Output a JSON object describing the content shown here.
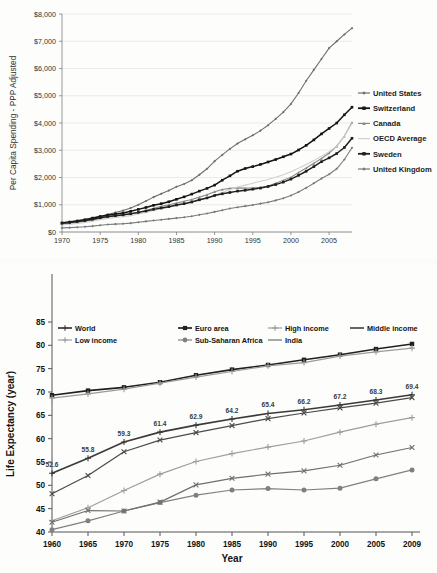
{
  "chart_data": [
    {
      "type": "line",
      "id": "health-spending",
      "title": "",
      "xlabel": "",
      "ylabel": "Per Capita Spending - PPP Adjusted",
      "xlim": [
        1970,
        2008
      ],
      "ylim": [
        0,
        8000
      ],
      "ytick_labels": [
        "$0",
        "$1,000",
        "$2,000",
        "$3,000",
        "$4,000",
        "$5,000",
        "$6,000",
        "$7,000",
        "$8,000"
      ],
      "ytick_values": [
        0,
        1000,
        2000,
        3000,
        4000,
        5000,
        6000,
        7000,
        8000
      ],
      "xtick_labels": [
        "1970",
        "1975",
        "1980",
        "1985",
        "1990",
        "1995",
        "2000",
        "2005"
      ],
      "xtick_values": [
        1970,
        1975,
        1980,
        1985,
        1990,
        1995,
        2000,
        2005
      ],
      "grid": "horizontal",
      "legend_position": "right",
      "x": [
        1970,
        1971,
        1972,
        1973,
        1974,
        1975,
        1976,
        1977,
        1978,
        1979,
        1980,
        1981,
        1982,
        1983,
        1984,
        1985,
        1986,
        1987,
        1988,
        1989,
        1990,
        1991,
        1992,
        1993,
        1994,
        1995,
        1996,
        1997,
        1998,
        1999,
        2000,
        2001,
        2002,
        2003,
        2004,
        2005,
        2006,
        2007,
        2008
      ],
      "series": [
        {
          "name": "United States",
          "color": "#6e6e6e",
          "marker": "diamond",
          "values": [
            350,
            380,
            420,
            455,
            505,
            570,
            640,
            715,
            790,
            880,
            1000,
            1140,
            1280,
            1400,
            1520,
            1660,
            1760,
            1900,
            2100,
            2320,
            2600,
            2830,
            3050,
            3250,
            3400,
            3550,
            3720,
            3920,
            4150,
            4400,
            4700,
            5100,
            5550,
            5950,
            6350,
            6750,
            7000,
            7250,
            7480
          ]
        },
        {
          "name": "Switzerland",
          "color": "#141414",
          "marker": "square",
          "values": [
            330,
            360,
            400,
            450,
            510,
            570,
            620,
            660,
            700,
            760,
            830,
            900,
            980,
            1040,
            1110,
            1200,
            1290,
            1390,
            1500,
            1600,
            1720,
            1900,
            2060,
            2230,
            2330,
            2400,
            2480,
            2570,
            2660,
            2760,
            2860,
            3010,
            3180,
            3380,
            3600,
            3800,
            4000,
            4300,
            4580
          ]
        },
        {
          "name": "Canada",
          "color": "#8a8a8a",
          "marker": "triangle",
          "values": [
            300,
            325,
            355,
            390,
            440,
            500,
            555,
            590,
            620,
            660,
            720,
            790,
            870,
            940,
            1000,
            1060,
            1130,
            1190,
            1280,
            1370,
            1480,
            1560,
            1600,
            1620,
            1610,
            1620,
            1640,
            1690,
            1790,
            1900,
            2010,
            2180,
            2350,
            2520,
            2700,
            2900,
            3150,
            3520,
            4020
          ]
        },
        {
          "name": "OECD Average",
          "color": "#cfcfcf",
          "marker": "none",
          "values": [
            260,
            285,
            315,
            350,
            395,
            450,
            500,
            530,
            560,
            600,
            660,
            720,
            790,
            850,
            910,
            970,
            1030,
            1090,
            1170,
            1250,
            1350,
            1450,
            1550,
            1650,
            1720,
            1790,
            1860,
            1930,
            2010,
            2100,
            2210,
            2340,
            2480,
            2620,
            2780,
            2950,
            3150,
            3520,
            3980
          ]
        },
        {
          "name": "Sweden",
          "color": "#1f1f1f",
          "marker": "square",
          "values": [
            320,
            350,
            385,
            420,
            470,
            525,
            570,
            600,
            630,
            670,
            720,
            770,
            830,
            880,
            930,
            990,
            1040,
            1100,
            1180,
            1250,
            1340,
            1400,
            1450,
            1500,
            1530,
            1570,
            1610,
            1670,
            1740,
            1830,
            1940,
            2080,
            2230,
            2400,
            2580,
            2720,
            2880,
            3100,
            3440
          ]
        },
        {
          "name": "United Kingdom",
          "color": "#7a7a7a",
          "marker": "diamond",
          "values": [
            150,
            160,
            175,
            190,
            215,
            250,
            275,
            290,
            305,
            325,
            360,
            390,
            420,
            450,
            480,
            510,
            540,
            580,
            630,
            680,
            740,
            800,
            860,
            910,
            950,
            990,
            1040,
            1090,
            1160,
            1240,
            1340,
            1470,
            1620,
            1790,
            1960,
            2120,
            2320,
            2660,
            3090
          ]
        }
      ]
    },
    {
      "type": "line",
      "id": "life-expectancy",
      "title": "",
      "xlabel": "Year",
      "ylabel": "Life Expectancy (year)",
      "xlim": [
        1960,
        2009
      ],
      "ylim": [
        40,
        85
      ],
      "ytick_labels": [
        "40",
        "45",
        "50",
        "55",
        "60",
        "65",
        "70",
        "75",
        "80",
        "85"
      ],
      "ytick_values": [
        40,
        45,
        50,
        55,
        60,
        65,
        70,
        75,
        80,
        85
      ],
      "categories": [
        "1960",
        "1965",
        "1970",
        "1975",
        "1980",
        "1985",
        "1990",
        "1995",
        "2000",
        "2005",
        "2009"
      ],
      "x": [
        1960,
        1965,
        1970,
        1975,
        1980,
        1985,
        1990,
        1995,
        2000,
        2005,
        2009
      ],
      "grid": "none",
      "legend_position": "top",
      "data_labels_series": "World",
      "data_labels": [
        "52.6",
        "55.8",
        "59.3",
        "61.4",
        "62.9",
        "64.2",
        "65.4",
        "66.2",
        "67.2",
        "68.3",
        "69.4"
      ],
      "series": [
        {
          "name": "World",
          "color": "#3a3a3a",
          "marker": "plus",
          "values": [
            52.6,
            55.8,
            59.3,
            61.4,
            62.9,
            64.2,
            65.4,
            66.2,
            67.2,
            68.3,
            69.4
          ]
        },
        {
          "name": "Euro area",
          "color": "#202020",
          "marker": "square",
          "values": [
            69.3,
            70.3,
            71.0,
            72.1,
            73.6,
            74.8,
            75.8,
            76.9,
            78.0,
            79.2,
            80.3
          ]
        },
        {
          "name": "High income",
          "color": "#9a9a9a",
          "marker": "plus",
          "values": [
            68.7,
            69.6,
            70.6,
            71.9,
            73.2,
            74.4,
            75.6,
            76.3,
            77.7,
            78.6,
            79.4
          ]
        },
        {
          "name": "Middle income",
          "color": "#4a4a4a",
          "marker": "x",
          "values": [
            48.2,
            52.1,
            57.2,
            59.7,
            61.3,
            62.8,
            64.3,
            65.5,
            66.6,
            67.6,
            68.8
          ]
        },
        {
          "name": "Low income",
          "color": "#9e9e9e",
          "marker": "plus",
          "values": [
            42.4,
            45.2,
            48.9,
            52.4,
            55.1,
            56.8,
            58.2,
            59.5,
            61.4,
            63.1,
            64.5
          ]
        },
        {
          "name": "Sub-Saharan Africa",
          "color": "#808080",
          "marker": "circle",
          "values": [
            40.5,
            42.4,
            44.5,
            46.3,
            47.9,
            49.0,
            49.3,
            49.0,
            49.4,
            51.4,
            53.3
          ]
        },
        {
          "name": "India",
          "color": "#6f6f6f",
          "marker": "x",
          "values": [
            42.1,
            44.6,
            44.5,
            46.4,
            50.1,
            51.5,
            52.4,
            53.1,
            54.3,
            56.5,
            58.1
          ]
        }
      ]
    }
  ]
}
